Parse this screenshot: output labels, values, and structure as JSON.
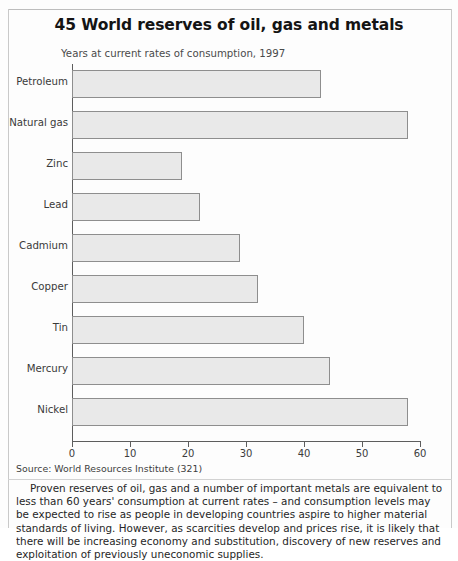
{
  "page": {
    "title": "45 World reserves of oil, gas and metals",
    "subtitle": "Years at current rates of consumption, 1997",
    "source": "Source: World Resources Institute (321)",
    "body_text": "Proven reserves of oil, gas and a number of important metals are equivalent to less than 60 years' consumption  at current rates – and consumption levels may be expected to rise as people in developing countries aspire to higher material standards of living. However, as scarcities develop and prices rise, it is likely that there will be increasing economy and substitution, discovery of new reserves and exploitation of previously uneconomic supplies."
  },
  "colors": {
    "bar_fill": "#e9e9e9",
    "bar_stroke": "#8e8e8e",
    "axis": "#5d5d5d",
    "text": "#262626"
  },
  "chart_data": {
    "type": "bar",
    "orientation": "horizontal",
    "title": "45 World reserves of oil, gas and metals",
    "subtitle": "Years at current rates of consumption, 1997",
    "xlabel": "",
    "ylabel": "",
    "xlim": [
      0,
      60
    ],
    "xticks": [
      0,
      10,
      20,
      30,
      40,
      50,
      60
    ],
    "grid": false,
    "legend": false,
    "categories": [
      "Petroleum",
      "Natural gas",
      "Zinc",
      "Lead",
      "Cadmium",
      "Copper",
      "Tin",
      "Mercury",
      "Nickel"
    ],
    "values": [
      43,
      58,
      19,
      22,
      29,
      32,
      40,
      44.5,
      58
    ],
    "units": "years"
  }
}
